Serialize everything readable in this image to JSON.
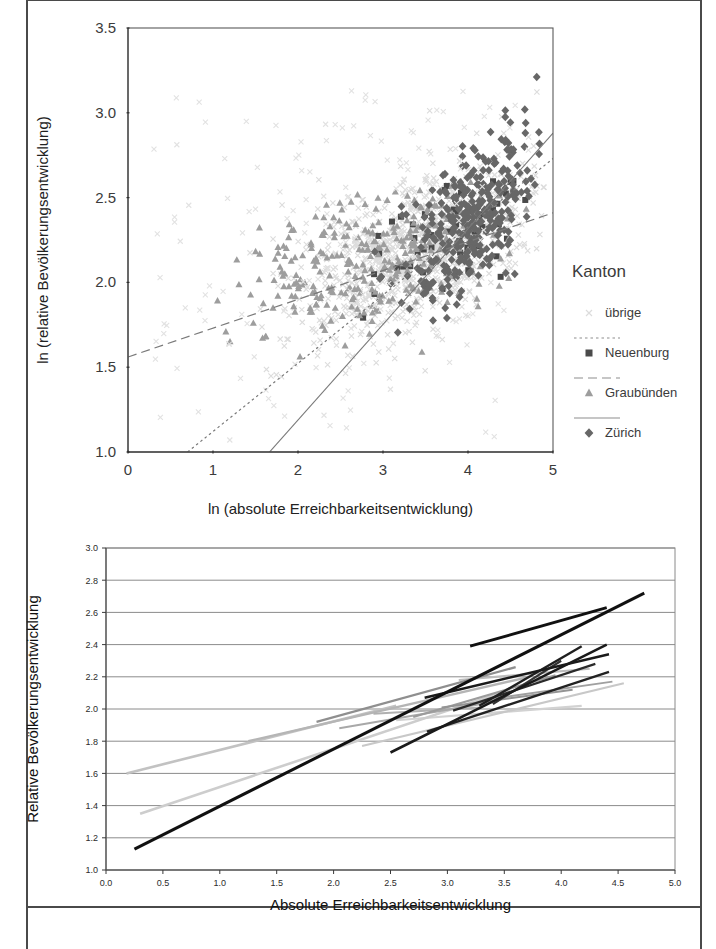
{
  "figure": {
    "background": "#ffffff",
    "frame_color": "#4a4a4a"
  },
  "top_chart": {
    "xlabel": "ln (absolute Erreichbarkeitsentwicklung)",
    "ylabel": "ln (relative Bevölkerungsentwicklung)",
    "x_ticks": [
      "0",
      "1",
      "2",
      "3",
      "4",
      "5"
    ],
    "y_ticks": [
      "1.0",
      "1.5",
      "2.0",
      "2.5",
      "3.0",
      "3.5"
    ],
    "legend": {
      "title": "Kanton",
      "items": [
        {
          "label": "übrige",
          "marker": "x-thin",
          "color": "#d9d9d9",
          "line": "none"
        },
        {
          "label": "Neuenburg",
          "marker": "square",
          "color": "#4d4d4d",
          "line": "dotted"
        },
        {
          "label": "Graubünden",
          "marker": "triangle",
          "color": "#9a9a9a",
          "line": "dashed"
        },
        {
          "label": "Zürich",
          "marker": "diamond",
          "color": "#6b6b6b",
          "line": "solid"
        }
      ]
    }
  },
  "bottom_chart": {
    "xlabel": "Absolute Erreichbarkeitsentwicklung",
    "ylabel": "Relative Bevölkerungsentwicklung",
    "x_ticks": [
      "0.0",
      "0.5",
      "1.0",
      "1.5",
      "2.0",
      "2.5",
      "3.0",
      "3.5",
      "4.0",
      "4.5",
      "5.0"
    ],
    "y_ticks": [
      "1.0",
      "1.2",
      "1.4",
      "1.6",
      "1.8",
      "2.0",
      "2.2",
      "2.4",
      "2.6",
      "2.8",
      "3.0"
    ]
  },
  "chart_data": [
    {
      "type": "scatter",
      "id": "top",
      "title": "",
      "xlabel": "ln (absolute Erreichbarkeitsentwicklung)",
      "ylabel": "ln (relative Bevölkerungsentwicklung)",
      "xlim": [
        0,
        5
      ],
      "ylim": [
        1.0,
        3.5
      ],
      "grid": false,
      "legend_position": "right",
      "legend_title": "Kanton",
      "series": [
        {
          "name": "übrige",
          "marker": "x",
          "color": "#dcdcdc",
          "trendline": null,
          "points_note": "dense light cloud, ~900 points centred near x 2.5-4.5, y 1.8-2.6",
          "cluster": {
            "n": 900,
            "cx": 3.45,
            "cy": 2.18,
            "sx": 0.72,
            "sy": 0.26,
            "rho": 0.55,
            "xclip": [
              0.05,
              4.9
            ],
            "yclip": [
              0.95,
              3.35
            ]
          }
        },
        {
          "name": "Neuenburg",
          "marker": "square",
          "color": "#4a4a4a",
          "trendline": {
            "style": "dotted",
            "x0": 0.65,
            "y0": 0.98,
            "x1": 5.0,
            "y1": 2.73
          },
          "cluster": {
            "n": 60,
            "cx": 3.75,
            "cy": 2.3,
            "sx": 0.45,
            "sy": 0.22,
            "rho": 0.55,
            "xclip": [
              2.6,
              4.7
            ],
            "yclip": [
              1.62,
              2.6
            ]
          }
        },
        {
          "name": "Graubünden",
          "marker": "triangle",
          "color": "#9d9d9d",
          "trendline": {
            "style": "dashed",
            "x0": 0.0,
            "y0": 1.56,
            "x1": 5.0,
            "y1": 2.41
          },
          "cluster": {
            "n": 330,
            "cx": 3.0,
            "cy": 2.14,
            "sx": 0.8,
            "sy": 0.22,
            "rho": 0.45,
            "xclip": [
              0.1,
              4.7
            ],
            "yclip": [
              1.55,
              2.6
            ]
          }
        },
        {
          "name": "Zürich",
          "marker": "diamond",
          "color": "#676767",
          "trendline": {
            "style": "solid",
            "x0": 1.63,
            "y0": 0.98,
            "x1": 5.0,
            "y1": 2.88
          },
          "cluster": {
            "n": 330,
            "cx": 4.02,
            "cy": 2.36,
            "sx": 0.38,
            "sy": 0.27,
            "rho": 0.6,
            "xclip": [
              2.9,
              4.85
            ],
            "yclip": [
              1.7,
              3.28
            ]
          }
        }
      ]
    },
    {
      "type": "line",
      "id": "bottom",
      "title": "",
      "xlabel": "Absolute Erreichbarkeitsentwicklung",
      "ylabel": "Relative Bevölkerungsentwicklung",
      "xlim": [
        0.0,
        5.0
      ],
      "ylim": [
        1.0,
        3.0
      ],
      "grid": "horizontal",
      "legend_position": "none",
      "segments": [
        {
          "x0": 0.25,
          "y0": 1.13,
          "x1": 4.73,
          "y1": 2.72,
          "color": "#111111",
          "width": 3.0
        },
        {
          "x0": 3.2,
          "y0": 2.39,
          "x1": 4.4,
          "y1": 2.63,
          "color": "#111111",
          "width": 2.8
        },
        {
          "x0": 2.5,
          "y0": 1.73,
          "x1": 4.4,
          "y1": 2.4,
          "color": "#1a1a1a",
          "width": 2.6
        },
        {
          "x0": 2.8,
          "y0": 2.07,
          "x1": 4.42,
          "y1": 2.34,
          "color": "#1a1a1a",
          "width": 2.4
        },
        {
          "x0": 2.82,
          "y0": 1.86,
          "x1": 4.42,
          "y1": 2.23,
          "color": "#222222",
          "width": 2.4
        },
        {
          "x0": 3.05,
          "y0": 1.99,
          "x1": 4.3,
          "y1": 2.28,
          "color": "#2a2a2a",
          "width": 2.2
        },
        {
          "x0": 3.28,
          "y0": 2.02,
          "x1": 4.18,
          "y1": 2.39,
          "color": "#1f1f1f",
          "width": 2.4
        },
        {
          "x0": 3.4,
          "y0": 2.03,
          "x1": 4.0,
          "y1": 2.3,
          "color": "#333333",
          "width": 2.2
        },
        {
          "x0": 0.18,
          "y0": 1.6,
          "x1": 2.55,
          "y1": 2.02,
          "color": "#c2c2c2",
          "width": 2.6
        },
        {
          "x0": 0.3,
          "y0": 1.35,
          "x1": 3.55,
          "y1": 2.12,
          "color": "#cdcdcd",
          "width": 2.6
        },
        {
          "x0": 1.25,
          "y0": 1.8,
          "x1": 3.72,
          "y1": 2.2,
          "color": "#b5b5b5",
          "width": 2.4
        },
        {
          "x0": 2.25,
          "y0": 1.77,
          "x1": 4.55,
          "y1": 2.16,
          "color": "#c8c8c8",
          "width": 2.2
        },
        {
          "x0": 2.55,
          "y0": 1.93,
          "x1": 4.18,
          "y1": 2.02,
          "color": "#d2d2d2",
          "width": 2.2
        },
        {
          "x0": 3.1,
          "y0": 2.18,
          "x1": 4.25,
          "y1": 2.25,
          "color": "#bdbdbd",
          "width": 2.2
        },
        {
          "x0": 1.85,
          "y0": 1.92,
          "x1": 3.6,
          "y1": 2.26,
          "color": "#8f8f8f",
          "width": 2.2
        },
        {
          "x0": 2.7,
          "y0": 1.95,
          "x1": 3.95,
          "y1": 2.21,
          "color": "#9c9c9c",
          "width": 2.2
        },
        {
          "x0": 2.05,
          "y0": 1.88,
          "x1": 3.45,
          "y1": 2.05,
          "color": "#a8a8a8",
          "width": 2.0
        },
        {
          "x0": 2.35,
          "y0": 1.97,
          "x1": 3.3,
          "y1": 2.01,
          "color": "#b0b0b0",
          "width": 2.0
        },
        {
          "x0": 3.35,
          "y0": 2.06,
          "x1": 4.45,
          "y1": 2.17,
          "color": "#a0a0a0",
          "width": 2.0
        },
        {
          "x0": 2.95,
          "y0": 2.01,
          "x1": 4.1,
          "y1": 2.12,
          "color": "#949494",
          "width": 2.0
        }
      ]
    }
  ]
}
